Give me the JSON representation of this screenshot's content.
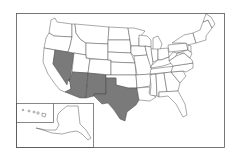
{
  "map": {
    "title": "United States map",
    "highlight_color": "#7a7a7a",
    "base_color": "#ffffff",
    "border_color": "#444444",
    "highlighted_states": [
      "Nevada",
      "Arizona",
      "New Mexico",
      "Texas"
    ],
    "insets": [
      "Alaska",
      "Hawaii"
    ]
  }
}
